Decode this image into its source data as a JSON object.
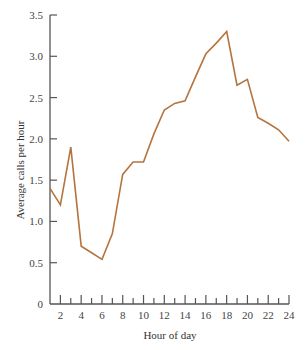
{
  "chart_data": {
    "type": "line",
    "title": "",
    "xlabel": "Hour of day",
    "ylabel": "Average calls per hour",
    "x": [
      1,
      2,
      3,
      4,
      5,
      6,
      7,
      8,
      9,
      10,
      11,
      12,
      13,
      14,
      15,
      16,
      17,
      18,
      19,
      20,
      21,
      22,
      23,
      24
    ],
    "series": [
      {
        "name": "Average calls per hour",
        "values": [
          1.4,
          1.2,
          1.9,
          0.7,
          0.62,
          0.54,
          0.85,
          1.57,
          1.72,
          1.72,
          2.06,
          2.35,
          2.43,
          2.46,
          2.75,
          3.03,
          3.16,
          3.3,
          2.65,
          2.72,
          2.26,
          2.19,
          2.11,
          1.97
        ]
      }
    ],
    "xlim": [
      1,
      24
    ],
    "ylim": [
      0,
      3.5
    ],
    "x_tick_labels": [
      "2",
      "4",
      "6",
      "8",
      "10",
      "12",
      "14",
      "16",
      "18",
      "20",
      "22",
      "24"
    ],
    "x_tick_values": [
      2,
      4,
      6,
      8,
      10,
      12,
      14,
      16,
      18,
      20,
      22,
      24
    ],
    "y_tick_labels": [
      "0",
      "0.5",
      "1.0",
      "1.5",
      "2.0",
      "2.5",
      "3.0",
      "3.5"
    ],
    "y_tick_values": [
      0,
      0.5,
      1.0,
      1.5,
      2.0,
      2.5,
      3.0,
      3.5
    ],
    "grid": false,
    "legend": "none",
    "colors": {
      "line": "#b5743e",
      "axis": "#555555"
    }
  }
}
